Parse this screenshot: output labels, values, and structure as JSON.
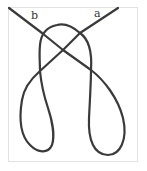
{
  "diagram": {
    "type": "knot-diagram",
    "labels": {
      "end_a": "a",
      "end_b": "b"
    },
    "colors": {
      "rope": "#3a3a3a",
      "frame": "#e2e2e2",
      "background": "#ffffff"
    }
  }
}
